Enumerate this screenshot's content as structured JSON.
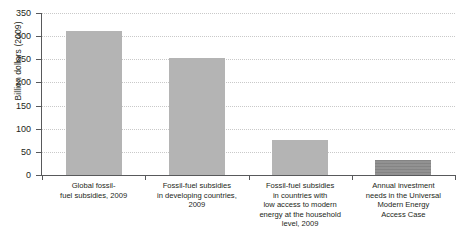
{
  "chart_data": {
    "type": "bar",
    "title": "",
    "xlabel": "",
    "ylabel": "Billion dollars (2009)",
    "ylim": [
      0,
      350
    ],
    "yticks": [
      0,
      50,
      100,
      150,
      200,
      250,
      300,
      350
    ],
    "ytick_labels": [
      "0",
      "50",
      "100",
      "150",
      "200",
      "250",
      "300",
      "350"
    ],
    "grid": true,
    "legend": "none",
    "categories": [
      "Global fossil-fuel subsidies, 2009",
      "Fossil-fuel subsidies in developing countries, 2009",
      "Fossil-fuel subsidies in countries with low access to modern energy at the household level, 2009",
      "Annual investment needs in the Universal Modern Energy Access Case"
    ],
    "category_label_lines": [
      [
        "Global fossil-",
        "fuel subsidies, 2009"
      ],
      [
        "Fossil-fuel subsidies",
        "in developing countries,",
        "2009"
      ],
      [
        "Fossil-fuel subsidies",
        "in countries with",
        "low access to modern",
        "energy at the household",
        "level, 2009"
      ],
      [
        "Annual investment",
        "needs in the Universal",
        "Modern Energy",
        "Access Case"
      ]
    ],
    "values": [
      312,
      253,
      75,
      33
    ],
    "bar_colors": [
      "#b4b4b4",
      "#b4b4b4",
      "#b4b4b4",
      "#8c8c8c"
    ],
    "axis_color": "#58595b",
    "gridline_color": "#c9c9c9",
    "text_color": "#231f20"
  }
}
